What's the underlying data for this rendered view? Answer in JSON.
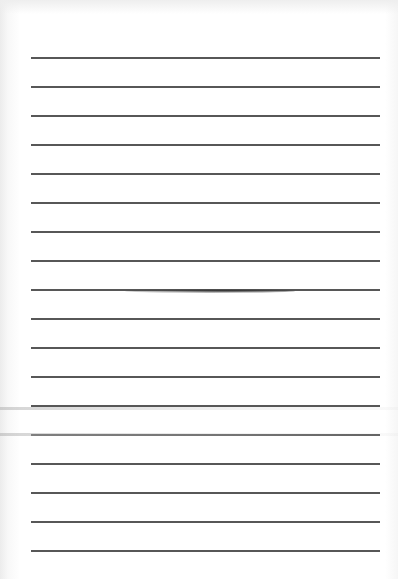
{
  "document": {
    "type": "blank lined paper",
    "ruled_line_count": 18,
    "has_text": false
  }
}
